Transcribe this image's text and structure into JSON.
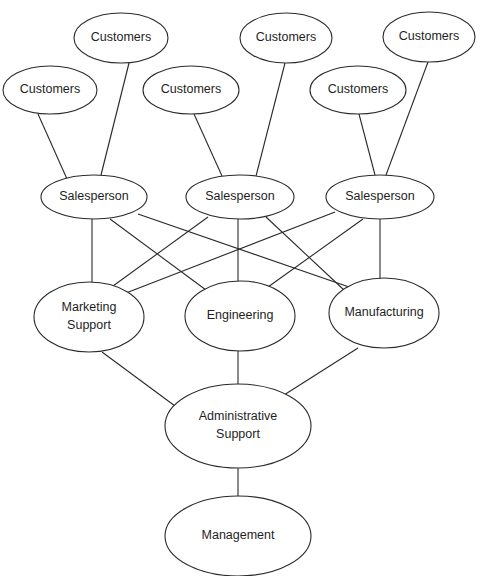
{
  "diagram": {
    "nodes": [
      {
        "id": "cust1",
        "label": [
          "Customers"
        ],
        "cx": 121,
        "cy": 38,
        "rx": 47,
        "ry": 25
      },
      {
        "id": "cust2",
        "label": [
          "Customers"
        ],
        "cx": 50,
        "cy": 90,
        "rx": 47,
        "ry": 24
      },
      {
        "id": "cust3",
        "label": [
          "Customers"
        ],
        "cx": 191,
        "cy": 90,
        "rx": 48,
        "ry": 24
      },
      {
        "id": "cust4",
        "label": [
          "Customers"
        ],
        "cx": 286,
        "cy": 38,
        "rx": 46,
        "ry": 25
      },
      {
        "id": "cust5",
        "label": [
          "Customers"
        ],
        "cx": 429,
        "cy": 37,
        "rx": 46,
        "ry": 25
      },
      {
        "id": "cust6",
        "label": [
          "Customers"
        ],
        "cx": 358,
        "cy": 90,
        "rx": 48,
        "ry": 24
      },
      {
        "id": "sales1",
        "label": [
          "Salesperson"
        ],
        "cx": 94,
        "cy": 197,
        "rx": 53,
        "ry": 22
      },
      {
        "id": "sales2",
        "label": [
          "Salesperson"
        ],
        "cx": 240,
        "cy": 197,
        "rx": 54,
        "ry": 22
      },
      {
        "id": "sales3",
        "label": [
          "Salesperson"
        ],
        "cx": 380,
        "cy": 197,
        "rx": 54,
        "ry": 22
      },
      {
        "id": "marketing",
        "label": [
          "Marketing",
          "Support"
        ],
        "cx": 89,
        "cy": 317,
        "rx": 55,
        "ry": 35
      },
      {
        "id": "engineering",
        "label": [
          "Engineering"
        ],
        "cx": 240,
        "cy": 316,
        "rx": 55,
        "ry": 35
      },
      {
        "id": "manufacturing",
        "label": [
          "Manufacturing"
        ],
        "cx": 384,
        "cy": 313,
        "rx": 55,
        "ry": 35
      },
      {
        "id": "admin",
        "label": [
          "Administrative",
          "Support"
        ],
        "cx": 238,
        "cy": 426,
        "rx": 73,
        "ry": 42
      },
      {
        "id": "management",
        "label": [
          "Management"
        ],
        "cx": 238,
        "cy": 536,
        "rx": 73,
        "ry": 40
      }
    ],
    "edges": [
      {
        "from": "cust2",
        "to": "sales1",
        "x1": 38,
        "y1": 114,
        "x2": 67,
        "y2": 179
      },
      {
        "from": "cust1",
        "to": "sales1",
        "x1": 129,
        "y1": 63,
        "x2": 101,
        "y2": 175
      },
      {
        "from": "cust3",
        "to": "sales2",
        "x1": 194,
        "y1": 114,
        "x2": 222,
        "y2": 176
      },
      {
        "from": "cust4",
        "to": "sales2",
        "x1": 285,
        "y1": 63,
        "x2": 256,
        "y2": 176
      },
      {
        "from": "cust6",
        "to": "sales3",
        "x1": 359,
        "y1": 114,
        "x2": 375,
        "y2": 175
      },
      {
        "from": "cust5",
        "to": "sales3",
        "x1": 428,
        "y1": 62,
        "x2": 386,
        "y2": 175
      },
      {
        "from": "sales1",
        "to": "marketing",
        "x1": 92,
        "y1": 219,
        "x2": 92,
        "y2": 283
      },
      {
        "from": "sales1",
        "to": "engineering",
        "x1": 110,
        "y1": 219,
        "x2": 206,
        "y2": 290
      },
      {
        "from": "sales1",
        "to": "manufacturing",
        "x1": 138,
        "y1": 214,
        "x2": 352,
        "y2": 288
      },
      {
        "from": "sales2",
        "to": "marketing",
        "x1": 208,
        "y1": 217,
        "x2": 113,
        "y2": 286
      },
      {
        "from": "sales2",
        "to": "engineering",
        "x1": 238,
        "y1": 219,
        "x2": 238,
        "y2": 282
      },
      {
        "from": "sales2",
        "to": "manufacturing",
        "x1": 266,
        "y1": 217,
        "x2": 344,
        "y2": 290
      },
      {
        "from": "sales3",
        "to": "marketing",
        "x1": 335,
        "y1": 212,
        "x2": 126,
        "y2": 293
      },
      {
        "from": "sales3",
        "to": "engineering",
        "x1": 363,
        "y1": 219,
        "x2": 268,
        "y2": 287
      },
      {
        "from": "sales3",
        "to": "manufacturing",
        "x1": 380,
        "y1": 219,
        "x2": 380,
        "y2": 279
      },
      {
        "from": "marketing",
        "to": "admin",
        "x1": 102,
        "y1": 352,
        "x2": 175,
        "y2": 406
      },
      {
        "from": "engineering",
        "to": "admin",
        "x1": 238,
        "y1": 351,
        "x2": 238,
        "y2": 384
      },
      {
        "from": "manufacturing",
        "to": "admin",
        "x1": 358,
        "y1": 348,
        "x2": 284,
        "y2": 395
      },
      {
        "from": "admin",
        "to": "management",
        "x1": 238,
        "y1": 468,
        "x2": 238,
        "y2": 496
      }
    ]
  }
}
